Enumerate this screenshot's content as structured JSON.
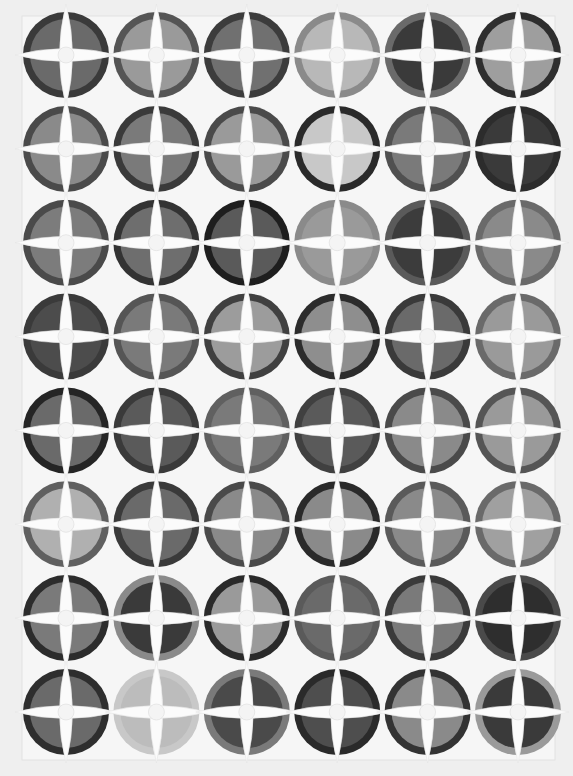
{
  "image": {
    "subject": "Photograph of a quilt with 48 circular four-wedge blocks arranged 6 columns by 8 rows on a white background",
    "grid": {
      "columns": 6,
      "rows": 8
    },
    "colors": {
      "background": "#efefef",
      "quilt_ground": "#f6f6f6",
      "petal": "#fbfbfb",
      "seam": "#d9d9d9"
    },
    "blocks": [
      [
        [
          "#3a3a3a",
          "#6a6a6a"
        ],
        [
          "#555555",
          "#9a9a9a"
        ],
        [
          "#3c3c3c",
          "#707070"
        ],
        [
          "#8a8a8a",
          "#b8b8b8"
        ],
        [
          "#6a6a6a",
          "#3a3a3a"
        ],
        [
          "#2e2e2e",
          "#9e9e9e"
        ]
      ],
      [
        [
          "#4a4a4a",
          "#8a8a8a"
        ],
        [
          "#3a3a3a",
          "#7a7a7a"
        ],
        [
          "#4a4a4a",
          "#9a9a9a"
        ],
        [
          "#2a2a2a",
          "#c8c8c8"
        ],
        [
          "#505050",
          "#7a7a7a"
        ],
        [
          "#2c2c2c",
          "#3a3a3a"
        ]
      ],
      [
        [
          "#4a4a4a",
          "#7c7c7c"
        ],
        [
          "#333333",
          "#6e6e6e"
        ],
        [
          "#1e1e1e",
          "#5a5a5a"
        ],
        [
          "#8a8a8a",
          "#9a9a9a"
        ],
        [
          "#5a5a5a",
          "#3c3c3c"
        ],
        [
          "#6a6a6a",
          "#8a8a8a"
        ]
      ],
      [
        [
          "#3a3a3a",
          "#4c4c4c"
        ],
        [
          "#555555",
          "#7a7a7a"
        ],
        [
          "#404040",
          "#9c9c9c"
        ],
        [
          "#2c2c2c",
          "#8e8e8e"
        ],
        [
          "#3a3a3a",
          "#6a6a6a"
        ],
        [
          "#6a6a6a",
          "#9a9a9a"
        ]
      ],
      [
        [
          "#252525",
          "#6a6a6a"
        ],
        [
          "#3a3a3a",
          "#5a5a5a"
        ],
        [
          "#606060",
          "#7a7a7a"
        ],
        [
          "#404040",
          "#5a5a5a"
        ],
        [
          "#4a4a4a",
          "#8a8a8a"
        ],
        [
          "#555555",
          "#9a9a9a"
        ]
      ],
      [
        [
          "#606060",
          "#b0b0b0"
        ],
        [
          "#3a3a3a",
          "#6a6a6a"
        ],
        [
          "#4a4a4a",
          "#8a8a8a"
        ],
        [
          "#2a2a2a",
          "#8a8a8a"
        ],
        [
          "#5a5a5a",
          "#8a8a8a"
        ],
        [
          "#6a6a6a",
          "#a0a0a0"
        ]
      ],
      [
        [
          "#2c2c2c",
          "#7a7a7a"
        ],
        [
          "#8a8a8a",
          "#3a3a3a"
        ],
        [
          "#2a2a2a",
          "#9a9a9a"
        ],
        [
          "#5a5a5a",
          "#6a6a6a"
        ],
        [
          "#3a3a3a",
          "#7a7a7a"
        ],
        [
          "#4a4a4a",
          "#2e2e2e"
        ]
      ],
      [
        [
          "#2e2e2e",
          "#6a6a6a"
        ],
        [
          "#c8c8c8",
          "#bcbcbc"
        ],
        [
          "#7a7a7a",
          "#4a4a4a"
        ],
        [
          "#2a2a2a",
          "#4e4e4e"
        ],
        [
          "#333333",
          "#8a8a8a"
        ],
        [
          "#9a9a9a",
          "#3a3a3a"
        ]
      ]
    ]
  }
}
